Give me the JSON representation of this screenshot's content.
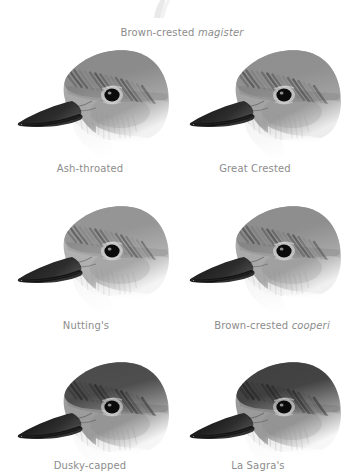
{
  "plate": {
    "title": "Myiarchus flycatcher head comparison plate",
    "background_color": "#ffffff",
    "caption_color": "#8c8c8c",
    "columns": 2,
    "rows": 3
  },
  "captions": {
    "top_overflow": {
      "common": "Brown-crested ",
      "scientific": "magister",
      "x": 182,
      "y": 27
    }
  },
  "birds": [
    {
      "id": "ash-throated",
      "common": "Ash-throated",
      "scientific": "",
      "label_x": 90,
      "label_y": 163,
      "cell_x": 8,
      "cell_y": 44,
      "crown_tone": "#8a8a8a",
      "face_tone": "#a8a8a8",
      "throat_tone": "#f2f2f2",
      "bill_tone": "#1a1a1a",
      "crown_darkness": 0.55,
      "throat_contrast": 0.45
    },
    {
      "id": "great-crested",
      "common": "Great Crested",
      "scientific": "",
      "label_x": 255,
      "label_y": 163,
      "cell_x": 180,
      "cell_y": 44,
      "crown_tone": "#8f8f8f",
      "face_tone": "#a3a3a3",
      "throat_tone": "#ededed",
      "bill_tone": "#151515",
      "crown_darkness": 0.58,
      "throat_contrast": 0.5
    },
    {
      "id": "nuttings",
      "common": "Nutting's",
      "scientific": "",
      "label_x": 86,
      "label_y": 320,
      "cell_x": 8,
      "cell_y": 200,
      "crown_tone": "#949494",
      "face_tone": "#b0b0b0",
      "throat_tone": "#f4f4f4",
      "bill_tone": "#1c1c1c",
      "crown_darkness": 0.5,
      "throat_contrast": 0.42
    },
    {
      "id": "brown-crested-cooperi",
      "common": "Brown-crested ",
      "scientific": "cooperi",
      "label_x": 272,
      "label_y": 320,
      "cell_x": 180,
      "cell_y": 200,
      "crown_tone": "#8d8d8d",
      "face_tone": "#a9a9a9",
      "throat_tone": "#f0f0f0",
      "bill_tone": "#181818",
      "crown_darkness": 0.56,
      "throat_contrast": 0.48
    },
    {
      "id": "dusky-capped",
      "common": "Dusky-capped",
      "scientific": "",
      "label_x": 90,
      "label_y": 460,
      "cell_x": 8,
      "cell_y": 356,
      "crown_tone": "#4a4a4a",
      "face_tone": "#9c9c9c",
      "throat_tone": "#f6f6f6",
      "bill_tone": "#111111",
      "crown_darkness": 0.82,
      "throat_contrast": 0.6
    },
    {
      "id": "la-sagras",
      "common": "La Sagra's",
      "scientific": "",
      "label_x": 258,
      "label_y": 460,
      "cell_x": 180,
      "cell_y": 356,
      "crown_tone": "#3f3f3f",
      "face_tone": "#9a9a9a",
      "throat_tone": "#f7f7f7",
      "bill_tone": "#0f0f0f",
      "crown_darkness": 0.86,
      "throat_contrast": 0.62
    }
  ]
}
